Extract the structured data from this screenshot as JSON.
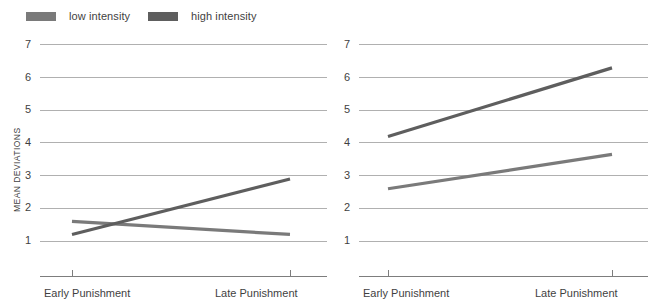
{
  "legend": {
    "items": [
      {
        "label": "low intensity",
        "color": "#7a7a7a",
        "key": "low"
      },
      {
        "label": "high intensity",
        "color": "#5e5e5e",
        "key": "high"
      }
    ]
  },
  "axis": {
    "y_title": "MEAN DEVIATIONS",
    "y_ticks": [
      "7",
      "6",
      "5",
      "4",
      "3",
      "2",
      "1"
    ],
    "x_ticks": [
      "Early Punishment",
      "Late Punishment"
    ]
  },
  "chart_data": [
    {
      "type": "line",
      "panel": "left",
      "title": "",
      "xlabel": "",
      "ylabel": "MEAN DEVIATIONS",
      "categories": [
        "Early Punishment",
        "Late Punishment"
      ],
      "x": [
        0,
        1
      ],
      "ylim": [
        0.35,
        7.0
      ],
      "yticks": [
        1,
        2,
        3,
        4,
        5,
        6,
        7
      ],
      "grid": true,
      "legend_position": "top-outside",
      "series": [
        {
          "name": "low intensity",
          "color": "#7a7a7a",
          "values": [
            1.6,
            1.2
          ]
        },
        {
          "name": "high intensity",
          "color": "#5e5e5e",
          "values": [
            1.2,
            2.9
          ]
        }
      ]
    },
    {
      "type": "line",
      "panel": "right",
      "title": "",
      "xlabel": "",
      "ylabel": "",
      "categories": [
        "Early Punishment",
        "Late Punishment"
      ],
      "x": [
        0,
        1
      ],
      "ylim": [
        0.35,
        7.0
      ],
      "yticks": [
        1,
        2,
        3,
        4,
        5,
        6,
        7
      ],
      "grid": true,
      "legend_position": "top-outside",
      "series": [
        {
          "name": "low intensity",
          "color": "#7a7a7a",
          "values": [
            2.6,
            3.65
          ]
        },
        {
          "name": "high intensity",
          "color": "#5e5e5e",
          "values": [
            4.2,
            6.3
          ]
        }
      ]
    }
  ]
}
